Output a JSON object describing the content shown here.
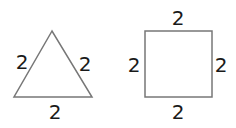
{
  "shapes": {
    "triangle": {
      "type": "equilateral-triangle",
      "labels": {
        "left": "2",
        "right": "2",
        "bottom": "2"
      }
    },
    "square": {
      "type": "square",
      "labels": {
        "top": "2",
        "left": "2",
        "right": "2",
        "bottom": "2"
      }
    }
  },
  "colors": {
    "stroke": "#777777",
    "text": "#1a1a1a"
  }
}
